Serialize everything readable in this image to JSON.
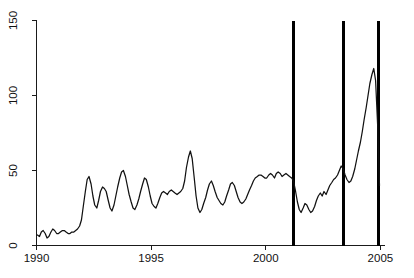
{
  "chart_data": {
    "type": "line",
    "title": "",
    "subtitle": "",
    "xlabel": "",
    "ylabel": "",
    "xlim": [
      1990.0,
      2005.2
    ],
    "ylim": [
      0,
      150
    ],
    "grid": false,
    "legend": null,
    "x_ticks": [
      1990,
      1995,
      2000,
      2005
    ],
    "x_tick_labels": [
      "1990",
      "1995",
      "2000",
      "2005"
    ],
    "y_ticks": [
      0,
      50,
      100,
      150
    ],
    "y_tick_labels": [
      "0",
      "50",
      "100",
      "150"
    ],
    "y_tick_label_rotation": 90,
    "line_color": "#111111",
    "annotations": {
      "vertical_lines": {
        "color": "#000000",
        "values": [
          2001.2,
          2003.4,
          2004.9
        ],
        "y_top": 150,
        "y_bottom": 0
      }
    },
    "series": [
      {
        "name": "value",
        "x": [
          1990.04,
          1990.13,
          1990.21,
          1990.29,
          1990.38,
          1990.46,
          1990.54,
          1990.63,
          1990.71,
          1990.79,
          1990.88,
          1990.96,
          1991.04,
          1991.13,
          1991.21,
          1991.29,
          1991.38,
          1991.46,
          1991.54,
          1991.63,
          1991.71,
          1991.79,
          1991.88,
          1991.96,
          1992.04,
          1992.13,
          1992.21,
          1992.29,
          1992.38,
          1992.46,
          1992.54,
          1992.63,
          1992.71,
          1992.79,
          1992.88,
          1992.96,
          1993.04,
          1993.13,
          1993.21,
          1993.29,
          1993.38,
          1993.46,
          1993.54,
          1993.63,
          1993.71,
          1993.79,
          1993.88,
          1993.96,
          1994.04,
          1994.13,
          1994.21,
          1994.29,
          1994.38,
          1994.46,
          1994.54,
          1994.63,
          1994.71,
          1994.79,
          1994.88,
          1994.96,
          1995.04,
          1995.13,
          1995.21,
          1995.29,
          1995.38,
          1995.46,
          1995.54,
          1995.63,
          1995.71,
          1995.79,
          1995.88,
          1995.96,
          1996.04,
          1996.13,
          1996.21,
          1996.29,
          1996.38,
          1996.46,
          1996.54,
          1996.63,
          1996.71,
          1996.79,
          1996.88,
          1996.96,
          1997.04,
          1997.13,
          1997.21,
          1997.29,
          1997.38,
          1997.46,
          1997.54,
          1997.63,
          1997.71,
          1997.79,
          1997.88,
          1997.96,
          1998.04,
          1998.13,
          1998.21,
          1998.29,
          1998.38,
          1998.46,
          1998.54,
          1998.63,
          1998.71,
          1998.79,
          1998.88,
          1998.96,
          1999.04,
          1999.13,
          1999.21,
          1999.29,
          1999.38,
          1999.46,
          1999.54,
          1999.63,
          1999.71,
          1999.79,
          1999.88,
          1999.96,
          2000.04,
          2000.13,
          2000.21,
          2000.29,
          2000.38,
          2000.46,
          2000.54,
          2000.63,
          2000.71,
          2000.79,
          2000.88,
          2000.96,
          2001.04,
          2001.13,
          2001.21,
          2001.29,
          2001.38,
          2001.46,
          2001.54,
          2001.63,
          2001.71,
          2001.79,
          2001.88,
          2001.96,
          2002.04,
          2002.13,
          2002.21,
          2002.29,
          2002.38,
          2002.46,
          2002.54,
          2002.63,
          2002.71,
          2002.79,
          2002.88,
          2002.96,
          2003.04,
          2003.13,
          2003.21,
          2003.29,
          2003.38,
          2003.46,
          2003.54,
          2003.63,
          2003.71,
          2003.79,
          2003.88,
          2003.96,
          2004.04,
          2004.13,
          2004.21,
          2004.29,
          2004.38,
          2004.46,
          2004.54,
          2004.63,
          2004.71,
          2004.79,
          2004.88,
          2004.96
        ],
        "values": [
          7,
          6,
          9,
          10,
          8,
          5,
          6,
          9,
          11,
          10,
          8,
          8,
          9,
          10,
          10,
          9,
          8,
          8,
          9,
          9,
          10,
          11,
          13,
          17,
          26,
          36,
          44,
          46,
          41,
          33,
          27,
          25,
          30,
          36,
          39,
          38,
          36,
          30,
          25,
          23,
          27,
          33,
          39,
          45,
          49,
          50,
          46,
          40,
          34,
          29,
          25,
          24,
          27,
          31,
          36,
          41,
          45,
          44,
          39,
          33,
          28,
          26,
          25,
          28,
          32,
          35,
          36,
          35,
          34,
          36,
          37,
          36,
          35,
          34,
          35,
          36,
          38,
          43,
          52,
          59,
          63,
          58,
          45,
          33,
          25,
          22,
          24,
          28,
          32,
          37,
          41,
          43,
          40,
          36,
          32,
          30,
          28,
          27,
          29,
          33,
          37,
          41,
          42,
          40,
          36,
          32,
          29,
          28,
          29,
          31,
          34,
          37,
          40,
          43,
          45,
          46,
          47,
          47,
          46,
          45,
          45,
          47,
          48,
          47,
          45,
          48,
          49,
          48,
          46,
          47,
          48,
          47,
          46,
          45,
          43,
          37,
          29,
          24,
          22,
          25,
          28,
          27,
          24,
          22,
          23,
          26,
          30,
          33,
          35,
          33,
          36,
          34,
          37,
          40,
          42,
          44,
          45,
          47,
          50,
          53,
          51,
          47,
          44,
          42,
          43,
          46,
          51,
          57,
          63,
          69,
          76,
          84,
          92,
          100,
          108,
          114,
          118,
          110,
          80,
          40
        ]
      }
    ]
  },
  "axes": {
    "y_axis_name": "y-axis",
    "x_axis_name": "x-axis"
  }
}
